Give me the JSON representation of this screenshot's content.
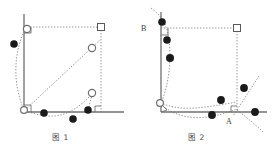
{
  "page": {
    "background_color": "#ffffff",
    "width": 274,
    "height": 147
  },
  "style": {
    "axis_color": "#6f6f6f",
    "dotted_color": "#8a8a8a",
    "filled_marker_color": "#1a1a1a",
    "open_marker_stroke": "#6f6f6f",
    "open_marker_fill": "#ffffff",
    "square_marker_stroke": "#5a5a5a",
    "caption_color": "#4a4a4a",
    "label_color": "#3a3a3a"
  },
  "figures": [
    {
      "id": "figure-1",
      "caption": "图 1",
      "axes": {
        "vertical_label": "",
        "horizontal_label": "",
        "origin_right_angle_marker": true,
        "top_right_angle_marker": true,
        "bottom_right_angle_marker": true
      },
      "markers": {
        "filled_circles": [
          {
            "name": "point-left-upper",
            "x": 14,
            "y": 44
          },
          {
            "name": "point-bottom-1",
            "x": 44,
            "y": 113
          },
          {
            "name": "point-bottom-2",
            "x": 73,
            "y": 119
          },
          {
            "name": "point-bottom-3",
            "x": 88,
            "y": 110
          }
        ],
        "open_circles": [
          {
            "name": "point-top-open",
            "x": 27,
            "y": 29
          },
          {
            "name": "point-origin-open",
            "x": 24,
            "y": 110
          },
          {
            "name": "point-diagonal-open",
            "x": 92,
            "y": 48
          },
          {
            "name": "point-right-open",
            "x": 92,
            "y": 93
          }
        ],
        "open_squares": [
          {
            "name": "corner-square-top-right",
            "x": 101,
            "y": 27
          }
        ]
      },
      "construction_lines": {
        "dotted_horizontal_top": true,
        "dotted_vertical_right": true,
        "dotted_diagonal": true,
        "dotted_arc_left": true,
        "dotted_arc_bottom": true
      }
    },
    {
      "id": "figure-2",
      "caption": "图 2",
      "axes": {
        "vertical_label": "B",
        "horizontal_label": "A",
        "origin_right_angle_marker": true,
        "top_right_angle_marker": true,
        "bottom_right_angle_marker": true
      },
      "markers": {
        "filled_circles": [
          {
            "name": "point-B",
            "x": 25,
            "y": 22
          },
          {
            "name": "point-left-1",
            "x": 30,
            "y": 40
          },
          {
            "name": "point-left-2",
            "x": 33,
            "y": 58
          },
          {
            "name": "point-bottom-mid",
            "x": 84,
            "y": 100
          },
          {
            "name": "point-bottom-low",
            "x": 75,
            "y": 115
          },
          {
            "name": "point-right-upper",
            "x": 107,
            "y": 88
          },
          {
            "name": "point-right-lower",
            "x": 118,
            "y": 112
          }
        ],
        "open_circles": [
          {
            "name": "point-origin-open",
            "x": 23,
            "y": 103
          }
        ],
        "open_squares": [
          {
            "name": "corner-square-top-right",
            "x": 100,
            "y": 27
          }
        ]
      },
      "construction_lines": {
        "dotted_horizontal_top": true,
        "dotted_vertical_right": true,
        "dotted_curve_left": true,
        "dotted_curve_bottom_upper": true,
        "dotted_curve_bottom_lower": true,
        "dotted_line_through_A": true
      }
    }
  ]
}
